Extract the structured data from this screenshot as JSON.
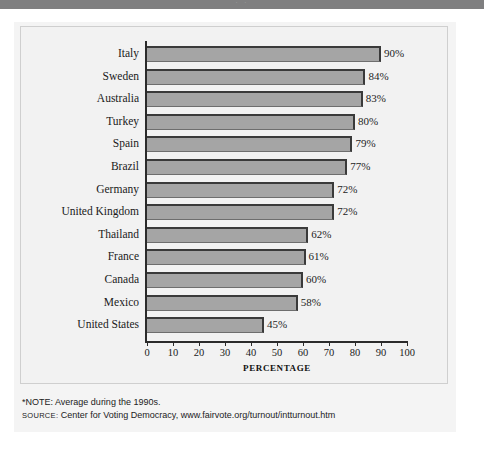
{
  "header": {
    "band_text": "· ·"
  },
  "chart_data": {
    "type": "bar",
    "orientation": "horizontal",
    "title": "",
    "xlabel": "PERCENTAGE",
    "ylabel": "",
    "xlim": [
      0,
      100
    ],
    "grid": false,
    "legend": "none",
    "tick_labels": [
      "0",
      "10",
      "20",
      "30",
      "40",
      "50",
      "60",
      "70",
      "80",
      "90",
      "100"
    ],
    "ticks": [
      0,
      10,
      20,
      30,
      40,
      50,
      60,
      70,
      80,
      90,
      100
    ],
    "categories": [
      "Italy",
      "Sweden",
      "Australia",
      "Turkey",
      "Spain",
      "Brazil",
      "Germany",
      "United Kingdom",
      "Thailand",
      "France",
      "Canada",
      "Mexico",
      "United States"
    ],
    "values": [
      90,
      84,
      83,
      80,
      79,
      77,
      72,
      72,
      62,
      61,
      60,
      58,
      45
    ],
    "data_labels": [
      "90%",
      "84%",
      "83%",
      "80%",
      "79%",
      "77%",
      "72%",
      "72%",
      "62%",
      "61%",
      "60%",
      "58%",
      "45%"
    ],
    "bar_color": "#a5a5a5",
    "bar_edge_color": "#3a3a3a",
    "plot_background": "#f2f2f2"
  },
  "notes": {
    "note": "*NOTE: Average during the 1990s.",
    "source_kicker": "SOURCE:",
    "source_text": "Center for Voting Democracy, www.fairvote.org/turnout/intturnout.htm"
  }
}
